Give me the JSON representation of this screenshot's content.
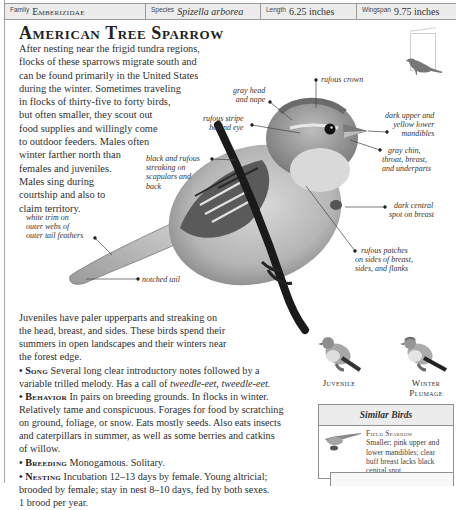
{
  "header": {
    "family": {
      "label": "Family",
      "value": "Emberizidae"
    },
    "species": {
      "label": "Species",
      "value": "Spizella arborea"
    },
    "length": {
      "label": "Length",
      "value": "6.25 inches"
    },
    "wingspan": {
      "label": "Wingspan",
      "value": "9.75 inches"
    }
  },
  "title": "American Tree Sparrow",
  "intro_lines": [
    "After nesting near the frigid tundra regions,",
    "flocks of these sparrows migrate south and",
    "can be found primarily in the United States",
    "during the winter. Sometimes traveling",
    "in flocks of thirty-five to forty birds,",
    "but often smaller, they scout out",
    "food supplies and willingly come",
    "to outdoor feeders. Males often",
    "winter farther north than",
    "females and juveniles.",
    "Males sing during",
    "courtship and also to",
    "claim territory."
  ],
  "callouts": {
    "rufous_crown": [
      "rufous crown"
    ],
    "gray_head": [
      "gray head",
      "and nape"
    ],
    "rufous_stripe": [
      "rufous stripe",
      "behind eye"
    ],
    "mandibles": [
      "dark upper and",
      "yellow lower",
      "mandibles"
    ],
    "gray_chin": [
      "gray chin,",
      "throat, breast,",
      "and underparts"
    ],
    "black_rufous": [
      "black and rufous",
      "streaking on",
      "scapulars and",
      "back"
    ],
    "dark_spot": [
      "dark central",
      "spot on breast"
    ],
    "white_trim": [
      "white trim on",
      "outer webs of",
      "outer tail feathers"
    ],
    "rufous_patches": [
      "rufous patches",
      "on sides of breast,",
      "sides, and flanks"
    ],
    "notched_tail": [
      "notched tail"
    ]
  },
  "juvenile_lines": [
    "Juveniles have paler upperparts and streaking on",
    "the head, breast, and sides. These birds spend their",
    "summers in open landscapes and their winters near",
    "the forest edge."
  ],
  "sections": {
    "song": {
      "heading": "Song",
      "line1": "Several long clear introductory notes followed by a",
      "line2_pre": "variable trilled melody. Has a call of ",
      "line2_call": "tweedle-eet, tweedle-eet.",
      "line2_post": ""
    },
    "behavior": {
      "heading": "Behavior",
      "line1": "In pairs on breeding grounds. In flocks in winter.",
      "lines": [
        "Relatively tame and conspicuous. Forages for food by scratching",
        "on ground, foliage, or snow. Eats mostly seeds. Also eats insects",
        "and caterpillars in summer, as well as some berries and catkins",
        "of willow."
      ]
    },
    "breeding": {
      "heading": "Breeding",
      "line1": "Monogamous. Solitary."
    },
    "nesting": {
      "heading": "Nesting",
      "line1": "Incubation 12–13 days by female. Young altricial;",
      "lines": [
        "brooded by female; stay in nest 8–10 days, fed by both sexes.",
        "1 brood per year."
      ]
    }
  },
  "thumbnails": {
    "juvenile": [
      "Juvenile"
    ],
    "winter": [
      "Winter",
      "Plumage"
    ]
  },
  "similar_birds": {
    "heading": "Similar Birds",
    "name": "Field Sparrow",
    "lines": [
      "Smaller; pink upper and",
      "lower mandibles; clear",
      "buff breast lacks black",
      "central spot."
    ]
  },
  "colors": {
    "header_bg": "#ececec",
    "border": "#9a9a9a",
    "text": "#2f2f2f"
  }
}
